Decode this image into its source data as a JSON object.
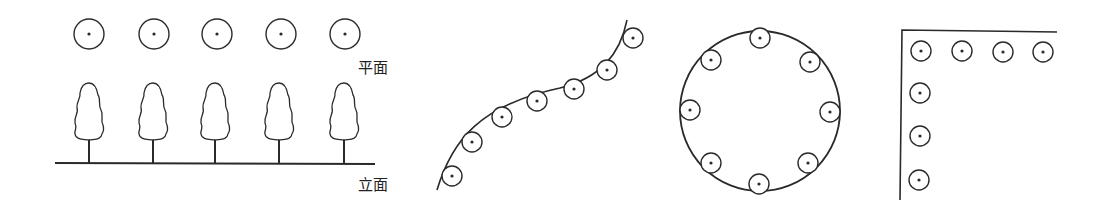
{
  "colors": {
    "stroke": "#2a2a2a",
    "background": "#ffffff"
  },
  "panels": [
    {
      "name": "row-planting",
      "labels": {
        "plan": "平面",
        "elevation": "立面"
      },
      "plan_circles": [
        [
          89,
          34
        ],
        [
          154,
          34
        ],
        [
          217,
          34
        ],
        [
          281,
          34
        ],
        [
          345,
          34
        ]
      ],
      "trees_x": [
        89,
        153,
        215,
        279,
        344
      ],
      "ground": {
        "x1": 55,
        "x2": 375,
        "y": 163
      }
    },
    {
      "name": "curve-planting",
      "curve_path": "M437,190 C452,140 480,105 560,88 C600,78 620,55 627,20",
      "circles": [
        [
          452,
          176
        ],
        [
          472,
          142
        ],
        [
          502,
          117
        ],
        [
          537,
          101
        ],
        [
          574,
          89
        ],
        [
          607,
          70
        ],
        [
          633,
          38
        ]
      ]
    },
    {
      "name": "ring-planting",
      "ring": {
        "cx": 760,
        "cy": 111,
        "r": 80
      },
      "circles": [
        [
          760,
          38
        ],
        [
          711,
          60
        ],
        [
          810,
          62
        ],
        [
          690,
          110
        ],
        [
          830,
          112
        ],
        [
          711,
          163
        ],
        [
          808,
          163
        ],
        [
          759,
          184
        ]
      ]
    },
    {
      "name": "corner-planting",
      "edges": {
        "corner": [
          902,
          30
        ],
        "h_end": [
          1057,
          32
        ],
        "v_end": [
          900,
          200
        ]
      },
      "circles": [
        [
          921,
          51
        ],
        [
          962,
          51
        ],
        [
          1003,
          52
        ],
        [
          1043,
          52
        ],
        [
          920,
          93
        ],
        [
          920,
          136
        ],
        [
          919,
          180
        ]
      ]
    }
  ]
}
